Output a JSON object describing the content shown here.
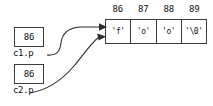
{
  "diagram": {
    "type": "c-pointer-memory-diagram",
    "array": {
      "name": "character-array",
      "addresses": [
        "86",
        "87",
        "88",
        "89"
      ],
      "cells": [
        "'f'",
        "'o'",
        "'o'",
        "'\\0'"
      ]
    },
    "pointers": [
      {
        "label": "c1.p",
        "value": "86"
      },
      {
        "label": "c2.p",
        "value": "86"
      }
    ],
    "arrows": [
      {
        "from": "c1.p",
        "to": "array-cell-0"
      },
      {
        "from": "c2.p",
        "to": "array-cell-0"
      }
    ],
    "colors": {
      "stroke": "#2b2b2b",
      "border": "#3c3c3c",
      "text": "#111111",
      "background": "#ffffff"
    }
  }
}
